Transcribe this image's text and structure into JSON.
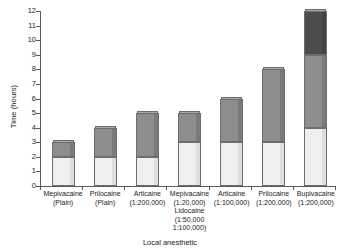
{
  "chart_data": {
    "type": "bar",
    "stacked": true,
    "title": "",
    "xlabel": "Local anesthetic",
    "ylabel": "Time (hours)",
    "ylim": [
      0,
      12
    ],
    "yticks": [
      0,
      1,
      2,
      3,
      4,
      5,
      6,
      7,
      8,
      9,
      10,
      11,
      12
    ],
    "grid": false,
    "legend": "none",
    "categories": [
      "Mepivacaine\n(Plain)",
      "Prilocaine\n(Plain)",
      "Articaine\n(1:200,000)",
      "Mepivacaine\n(1:20,000)\nLidocaine\n(1:50,000\n1:100,000)",
      "Articaine\n(1:100,000)",
      "Prilocaine\n(1:200,000)",
      "Bupivacaine\n(1:200,000)"
    ],
    "series": [
      {
        "name": "light-segment",
        "color": "#efefed",
        "values": [
          2,
          2,
          2,
          3,
          3,
          3,
          4
        ]
      },
      {
        "name": "mid-segment",
        "color": "#8d8d8d",
        "values": [
          3,
          4,
          5,
          5,
          6,
          8,
          9
        ]
      },
      {
        "name": "dark-segment",
        "color": "#4d4d4d",
        "values": [
          3,
          4,
          5,
          5,
          6,
          8,
          12
        ]
      }
    ],
    "totals": [
      3,
      4,
      5,
      5,
      6,
      8,
      12
    ]
  },
  "axis": {
    "y_title": "Time (hours)",
    "x_title": "Local anesthetic",
    "y_tick_labels": [
      "12",
      "11",
      "10",
      "9",
      "8",
      "7",
      "6",
      "5",
      "4",
      "3",
      "2",
      "1",
      "0"
    ]
  }
}
